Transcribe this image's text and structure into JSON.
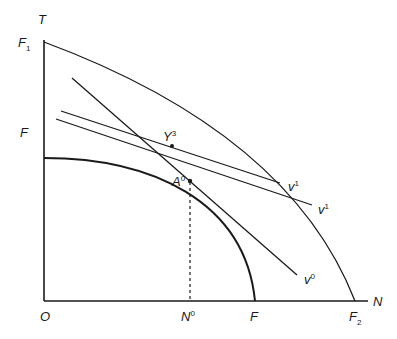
{
  "diagram": {
    "type": "production-possibility / indifference diagram",
    "axes": {
      "y_label": "T",
      "x_label": "N",
      "origin_label": "O"
    },
    "curves": [
      {
        "name": "outer-frontier",
        "from_label": "F₁",
        "to_label": "F₂"
      },
      {
        "name": "inner-frontier",
        "from_label": "F",
        "to_label": "F"
      }
    ],
    "lines": [
      {
        "name": "v0-line",
        "label": "v",
        "sup": "0"
      },
      {
        "name": "v1-line-a",
        "label": "v",
        "sup": "1"
      },
      {
        "name": "v1-line-b",
        "label": "v",
        "sup": "1"
      }
    ],
    "points": [
      {
        "name": "A0",
        "label": "A",
        "sup": "0"
      },
      {
        "name": "Y3",
        "label": "Y",
        "sup": "3"
      }
    ],
    "labels": {
      "T": "T",
      "N": "N",
      "O": "O",
      "F1_main": "F",
      "F1_sub": "1",
      "F_y": "F",
      "F_x": "F",
      "F2_main": "F",
      "F2_sub": "2",
      "N0_main": "N",
      "N0_sup": "0",
      "A0_main": "A",
      "A0_sup": "0",
      "Y3_main": "Y",
      "Y3_sup": "3",
      "v0_main": "v",
      "v0_sup": "0",
      "v1a_main": "v",
      "v1a_sup": "1",
      "v1b_main": "v",
      "v1b_sup": "1"
    },
    "colors": {
      "ink": "#1a1a1a",
      "background": "#ffffff"
    }
  }
}
